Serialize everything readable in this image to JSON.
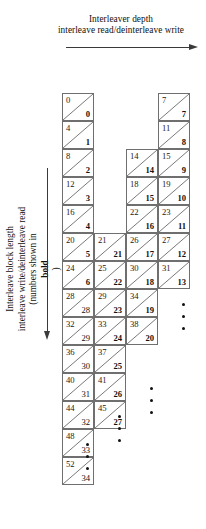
{
  "figure": {
    "top_caption": {
      "line1": "Interleaver depth",
      "line2": "interleave read/deinterleave write",
      "arrow": "right-arrow"
    },
    "left_caption": {
      "line1": "Interleave block length",
      "line2": "interleave write/deinterleave read",
      "line3_prefix": "(numbers shown in ",
      "line3_bold": "bold",
      "line3_suffix": ")",
      "arrow": "down-arrow"
    },
    "grid": {
      "columns": [
        {
          "index": 1,
          "cells": [
            {
              "top": "0",
              "bottom": "0",
              "bold": true
            },
            {
              "top": "4",
              "bottom": "1",
              "bold": true
            },
            {
              "top": "8",
              "bottom": "2",
              "bold": true
            },
            {
              "top": "12",
              "bottom": "3",
              "bold": true
            },
            {
              "top": "16",
              "bottom": "4",
              "bold": true
            },
            {
              "top": "20",
              "bottom": "5",
              "bold": true
            },
            {
              "top": "24",
              "bottom": "6",
              "bold": true
            },
            {
              "top": "28",
              "bottom": "28",
              "bold": false
            },
            {
              "top": "32",
              "bottom": "29",
              "bold": false
            },
            {
              "top": "36",
              "bottom": "30",
              "bold": false
            },
            {
              "top": "40",
              "bottom": "31",
              "bold": false
            },
            {
              "top": "44",
              "bottom": "32",
              "bold": false
            },
            {
              "top": "48",
              "bottom": "33",
              "bold": false
            },
            {
              "top": "52",
              "bottom": "34",
              "bold": false
            }
          ]
        },
        {
          "index": 2,
          "cells": [
            {
              "top": "21",
              "bottom": "21",
              "bold": true
            },
            {
              "top": "25",
              "bottom": "22",
              "bold": true
            },
            {
              "top": "29",
              "bottom": "23",
              "bold": true
            },
            {
              "top": "33",
              "bottom": "24",
              "bold": true
            },
            {
              "top": "37",
              "bottom": "25",
              "bold": true
            },
            {
              "top": "41",
              "bottom": "26",
              "bold": true
            },
            {
              "top": "45",
              "bottom": "27",
              "bold": true
            }
          ]
        },
        {
          "index": 3,
          "cells": [
            {
              "top": "14",
              "bottom": "14",
              "bold": true
            },
            {
              "top": "18",
              "bottom": "15",
              "bold": true
            },
            {
              "top": "22",
              "bottom": "16",
              "bold": true
            },
            {
              "top": "26",
              "bottom": "17",
              "bold": true
            },
            {
              "top": "30",
              "bottom": "18",
              "bold": true
            },
            {
              "top": "34",
              "bottom": "19",
              "bold": true
            },
            {
              "top": "38",
              "bottom": "20",
              "bold": true
            }
          ]
        },
        {
          "index": 4,
          "cells": [
            {
              "top": "7",
              "bottom": "7",
              "bold": true
            },
            {
              "top": "11",
              "bottom": "8",
              "bold": true
            },
            {
              "top": "15",
              "bottom": "9",
              "bold": true
            },
            {
              "top": "19",
              "bottom": "10",
              "bold": true
            },
            {
              "top": "23",
              "bottom": "11",
              "bold": true
            },
            {
              "top": "27",
              "bottom": "12",
              "bold": true
            },
            {
              "top": "31",
              "bottom": "13",
              "bold": true
            }
          ]
        }
      ],
      "ellipses": [
        {
          "label": "ellipsis-col4",
          "dots": 3
        },
        {
          "label": "ellipsis-col3",
          "dots": 3
        },
        {
          "label": "ellipsis-col2",
          "dots": 3
        }
      ]
    },
    "colors": {
      "line": "#6f6f6f",
      "arrow": "#3a3a3a",
      "text": "#1a1a1a",
      "background": "#ffffff"
    }
  }
}
